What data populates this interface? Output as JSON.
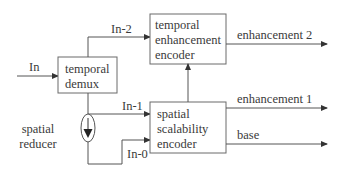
{
  "diagram": {
    "blocks": {
      "temporal_demux": {
        "lines": [
          "temporal",
          "demux"
        ]
      },
      "temporal_enhancement_encoder": {
        "lines": [
          "temporal",
          "enhancement",
          "encoder"
        ]
      },
      "spatial_scalability_encoder": {
        "lines": [
          "spatial",
          "scalability",
          "encoder"
        ]
      },
      "spatial_reducer": {
        "lines": [
          "spatial",
          "reducer"
        ],
        "icon": "down-arrow-in-ellipse"
      }
    },
    "signals": {
      "input": "In",
      "in_minus_2": "In-2",
      "in_minus_1": "In-1",
      "in_minus_0": "In-0"
    },
    "outputs": {
      "enhancement_2": "enhancement 2",
      "enhancement_1": "enhancement 1",
      "base": "base"
    },
    "colors": {
      "line": "#555555",
      "text": "#3a3a3a",
      "box_border": "#6a6a6a"
    }
  }
}
